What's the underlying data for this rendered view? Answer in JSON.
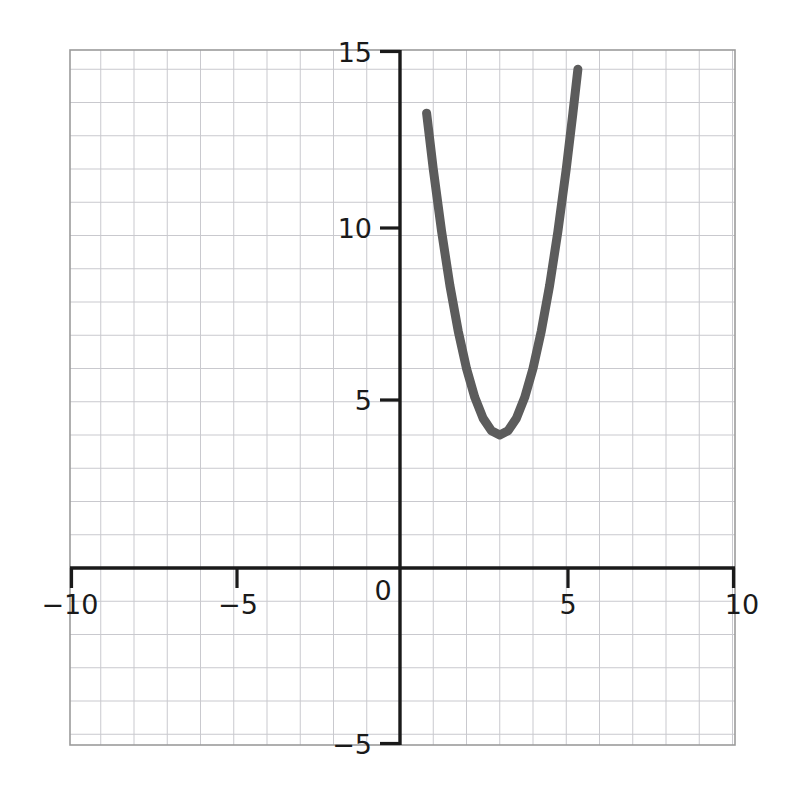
{
  "chart_data": {
    "type": "line",
    "title": "",
    "xlabel": "",
    "ylabel": "",
    "xlim": [
      -10,
      10
    ],
    "ylim": [
      -5,
      15.9
    ],
    "grid": true,
    "grid_step": 1,
    "legend": "none",
    "x_ticks": [
      {
        "value": -10,
        "label": "−10"
      },
      {
        "value": -5,
        "label": "−5"
      },
      {
        "value": 0,
        "label": "0"
      },
      {
        "value": 5,
        "label": "5"
      },
      {
        "value": 10,
        "label": "10"
      }
    ],
    "y_ticks": [
      {
        "value": -5,
        "label": "−5"
      },
      {
        "value": 5,
        "label": "5"
      },
      {
        "value": 10,
        "label": "10"
      },
      {
        "value": 15,
        "label": "15"
      }
    ],
    "series": [
      {
        "name": "parabola",
        "equation": "y = 2(x - 3)^2 + 4",
        "color": "#5c5c5c",
        "line_width": 9,
        "vertex": [
          3,
          4
        ],
        "x_range": [
          0.65,
          5.35
        ],
        "points": [
          [
            0.65,
            17.05
          ],
          [
            0.8,
            13.68
          ],
          [
            1.0,
            12.0
          ],
          [
            1.25,
            10.13
          ],
          [
            1.5,
            8.5
          ],
          [
            1.75,
            7.13
          ],
          [
            2.0,
            6.0
          ],
          [
            2.25,
            5.13
          ],
          [
            2.5,
            4.5
          ],
          [
            2.75,
            4.13
          ],
          [
            3.0,
            4.0
          ],
          [
            3.25,
            4.13
          ],
          [
            3.5,
            4.5
          ],
          [
            3.75,
            5.13
          ],
          [
            4.0,
            6.0
          ],
          [
            4.25,
            7.13
          ],
          [
            4.5,
            8.5
          ],
          [
            4.75,
            10.13
          ],
          [
            5.0,
            12.0
          ],
          [
            5.2,
            13.68
          ],
          [
            5.35,
            15.0
          ]
        ]
      }
    ]
  },
  "axes": {
    "x_axis_name": "x-axis",
    "y_axis_name": "y-axis",
    "axis_color": "#1a1a1a",
    "grid_color": "#c8c8cc",
    "border_color": "#9a9a9a",
    "background": "#ffffff"
  },
  "tick_labels": {
    "x_neg10": "−10",
    "x_neg5": "−5",
    "origin": "0",
    "x_pos5": "5",
    "x_pos10": "10",
    "y_15": "15",
    "y_10": "10",
    "y_5": "5",
    "y_neg5": "−5"
  }
}
